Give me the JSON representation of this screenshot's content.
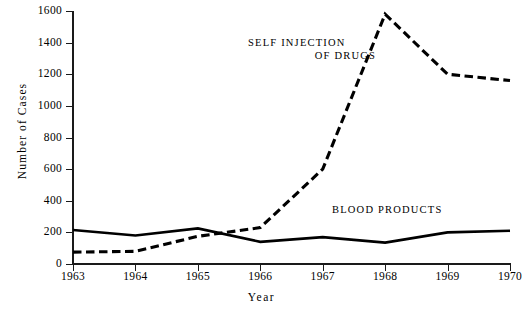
{
  "chart_data": {
    "type": "line",
    "title": "",
    "xlabel": "Year",
    "ylabel": "Number of Cases",
    "x": [
      1963,
      1964,
      1965,
      1966,
      1967,
      1968,
      1969,
      1970
    ],
    "categories": [
      "1963",
      "1964",
      "1965",
      "1966",
      "1967",
      "1968",
      "1969",
      "1970"
    ],
    "xlim": [
      1963,
      1970
    ],
    "ylim": [
      0,
      1600
    ],
    "yticks": [
      0,
      200,
      400,
      600,
      800,
      1000,
      1200,
      1400,
      1600
    ],
    "ytick_labels": [
      "0",
      "200",
      "400",
      "600",
      "800",
      "1000",
      "1200",
      "1400",
      "1600"
    ],
    "grid": false,
    "legend_position": "inline-annotation",
    "series": [
      {
        "name": "SELF INJECTION OF DRUGS",
        "label_line1": "SELF INJECTION",
        "label_line2": "OF DRUGS",
        "style": "dashed",
        "color": "#000000",
        "values": [
          75,
          80,
          175,
          230,
          600,
          1580,
          1200,
          1160
        ]
      },
      {
        "name": "BLOOD PRODUCTS",
        "label_line1": "BLOOD PRODUCTS",
        "style": "solid",
        "color": "#000000",
        "values": [
          215,
          180,
          225,
          140,
          170,
          135,
          200,
          210
        ]
      }
    ]
  },
  "axes": {
    "y_title": "Number of Cases",
    "x_title": "Year",
    "y_tick_labels": [
      "1600",
      "1400",
      "1200",
      "1000",
      "800",
      "600",
      "400",
      "200",
      "0"
    ],
    "x_tick_labels": [
      "1963",
      "1964",
      "1965",
      "1966",
      "1967",
      "1968",
      "1969",
      "1970"
    ]
  },
  "annotations": {
    "self_injection_line1": "SELF INJECTION",
    "self_injection_line2": "OF DRUGS",
    "blood_products": "BLOOD PRODUCTS"
  },
  "colors": {
    "ink": "#000000",
    "axis": "#1a1a1a",
    "background": "#ffffff"
  }
}
